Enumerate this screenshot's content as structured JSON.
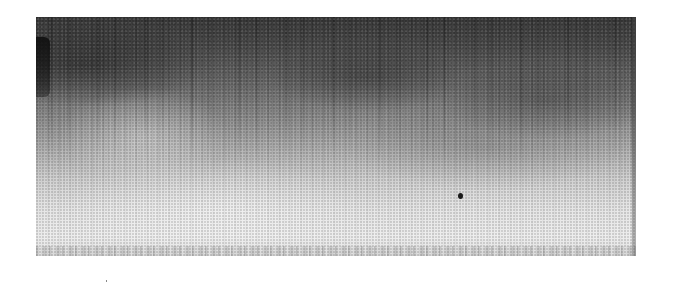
{
  "image": {
    "kind": "halftone grayscale photograph",
    "subject": "textured surface with vertical streaks, dark at top fading to light at bottom",
    "colors": {
      "top_tone": "#3a3a3a",
      "mid_tone": "#8e8e8e",
      "bottom_tone": "#eeeeee",
      "background": "#ffffff",
      "spot": "#1a1a1a"
    },
    "features": [
      "dark-to-light vertical gradient",
      "vertical streak texture",
      "dark spot in lower right area",
      "dark mark on upper-left edge"
    ]
  }
}
